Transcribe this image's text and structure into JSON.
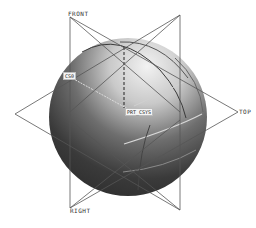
{
  "viewport": {
    "background": "#ffffff",
    "model": "sphere",
    "datum_planes": [
      {
        "name": "FRONT",
        "label": "FRONT"
      },
      {
        "name": "TOP",
        "label": "TOP"
      },
      {
        "name": "RIGHT",
        "label": "RIGHT"
      }
    ],
    "csys_labels": {
      "left": "CS0",
      "center": "PRT_CSYS"
    },
    "colors": {
      "datum_line": "#555555",
      "sphere_light": "#e8e8e8",
      "sphere_dark": "#2a2a2a",
      "edge_curve": "#cfcfcf"
    }
  }
}
